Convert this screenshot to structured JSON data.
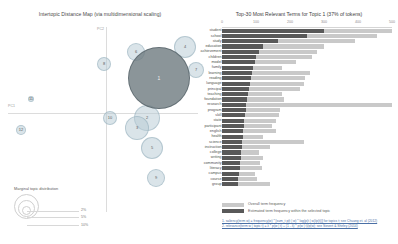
{
  "left_panel": {
    "title": "Intertopic Distance Map (via multidimensional scaling)",
    "axis_y_label": "PC2",
    "axis_x_label": "PC1",
    "legend": {
      "title": "Marginal topic distribution",
      "sizes": [
        "2%",
        "5%",
        "10%"
      ]
    },
    "topics": [
      {
        "id": "1",
        "x": 159,
        "y": 78,
        "r": 31,
        "selected": true
      },
      {
        "id": "2",
        "x": 147,
        "y": 118,
        "r": 13
      },
      {
        "id": "3",
        "x": 137,
        "y": 128,
        "r": 12
      },
      {
        "id": "4",
        "x": 185,
        "y": 47,
        "r": 11
      },
      {
        "id": "5",
        "x": 152,
        "y": 148,
        "r": 11
      },
      {
        "id": "6",
        "x": 136,
        "y": 52,
        "r": 9
      },
      {
        "id": "7",
        "x": 196,
        "y": 70,
        "r": 8
      },
      {
        "id": "8",
        "x": 104,
        "y": 64,
        "r": 7
      },
      {
        "id": "9",
        "x": 156,
        "y": 178,
        "r": 9
      },
      {
        "id": "10",
        "x": 110,
        "y": 118,
        "r": 7
      },
      {
        "id": "11",
        "x": 31,
        "y": 99,
        "r": 3
      },
      {
        "id": "12",
        "x": 21,
        "y": 130,
        "r": 5
      }
    ]
  },
  "right_panel": {
    "title": "Top-30 Most Relevant Terms for Topic 1 (37% of tokens)",
    "x_ticks": [
      "0",
      "100",
      "200",
      "300",
      "400",
      "500"
    ],
    "x_max": 500,
    "legend": [
      {
        "key": "overall",
        "label": "Overall term frequency"
      },
      {
        "key": "estimated",
        "label": "Estimated term frequency within the selected topic"
      }
    ],
    "citations": [
      "1. saliency(term w) = frequency(w) * [sum_t p(t | w) * log(p(t | w)/p(t))] for topics t; see Chuang et. al (2012)",
      "2. relevance(term w | topic t) = λ * p(w | t) + (1 - λ) * p(w | t)/p(w); see Sievert & Shirley (2014)"
    ]
  },
  "chart_data": {
    "type": "bar",
    "title": "Top-30 Most Relevant Terms for Topic 1 (37% of tokens)",
    "xlabel": "",
    "ylabel": "",
    "xlim": [
      0,
      500
    ],
    "grid": false,
    "orientation": "horizontal",
    "legend_position": "bottom-left",
    "categories": [
      "student",
      "school",
      "study",
      "education",
      "achievement",
      "children",
      "model",
      "family",
      "learning",
      "reading",
      "language",
      "principal",
      "teaching",
      "foundation",
      "research",
      "program",
      "skill",
      "state",
      "participant",
      "english",
      "health",
      "science",
      "instruction",
      "college",
      "writing",
      "community",
      "literacy",
      "campus",
      "course",
      "group"
    ],
    "series": [
      {
        "name": "Overall term frequency",
        "values": [
          500,
          455,
          390,
          300,
          278,
          265,
          218,
          175,
          260,
          245,
          240,
          228,
          175,
          183,
          500,
          170,
          168,
          158,
          148,
          160,
          120,
          240,
          140,
          108,
          120,
          112,
          118,
          96,
          104,
          140
        ]
      },
      {
        "name": "Estimated term frequency within the selected topic",
        "values": [
          300,
          250,
          165,
          122,
          108,
          100,
          96,
          90,
          88,
          86,
          82,
          80,
          76,
          74,
          72,
          70,
          68,
          66,
          64,
          63,
          62,
          60,
          58,
          56,
          55,
          53,
          52,
          50,
          48,
          46
        ]
      }
    ]
  }
}
